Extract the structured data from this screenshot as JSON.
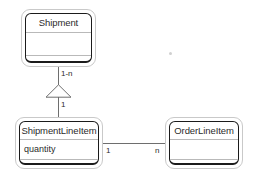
{
  "diagram": {
    "type": "uml-class-diagram",
    "background_color": "#ffffff",
    "line_color": "#6e6e6e",
    "box_border_color": "#1b1b1b",
    "box_outer_border_color": "#c9c9c9",
    "text_color": "#2b2b2b",
    "classes": [
      {
        "id": "shipment",
        "name": "Shipment",
        "attributes": [
          ""
        ],
        "operations": [
          ""
        ]
      },
      {
        "id": "shipmentlineitem",
        "name": "ShipmentLineItem",
        "attributes": [
          "quantity"
        ],
        "operations": [
          ""
        ]
      },
      {
        "id": "orderlineitem",
        "name": "OrderLineItem",
        "attributes": [
          ""
        ],
        "operations": [
          ""
        ]
      }
    ],
    "relationships": [
      {
        "id": "generalization-shipment",
        "kind": "generalization",
        "from": "ShipmentLineItem",
        "to": "Shipment",
        "target_multiplicity": "1-n",
        "source_multiplicity": "1"
      },
      {
        "id": "association-lineitems",
        "kind": "association",
        "from": "ShipmentLineItem",
        "to": "OrderLineItem",
        "source_multiplicity": "1",
        "target_multiplicity": "n"
      }
    ]
  }
}
